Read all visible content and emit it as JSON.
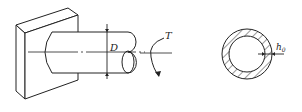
{
  "diagram": {
    "left_figure": {
      "description": "Shaft fixed to a wall, subjected to torque",
      "dimension_label": "D",
      "torque_label": "T"
    },
    "right_figure": {
      "description": "Hollow circular cross-section with wall thickness",
      "thickness_label": "h",
      "thickness_subscript": "0"
    },
    "colors": {
      "line": "#222222",
      "background": "#ffffff"
    }
  }
}
